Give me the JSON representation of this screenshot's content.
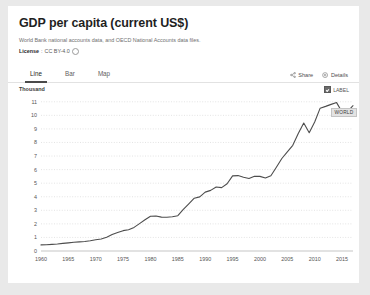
{
  "card": {
    "title": "GDP per capita (current US$)",
    "subtitle": "World Bank national accounts data, and OECD National Accounts data files.",
    "license_label": "License",
    "license_sep": ":",
    "license_value": "CC BY-4.0"
  },
  "tabs": [
    {
      "label": "Line",
      "active": true
    },
    {
      "label": "Bar",
      "active": false
    },
    {
      "label": "Map",
      "active": false
    }
  ],
  "actions": {
    "share": "Share",
    "details": "Details"
  },
  "legend": {
    "label": "LABEL",
    "checked": true
  },
  "series_badge": "WORLD",
  "colors": {
    "page_bg": "#e9e9e9",
    "card_bg": "#ffffff",
    "title": "#1f1f1f",
    "line": "#4d4d4d",
    "grid": "#d8d8d8",
    "axis": "#b6b6b6",
    "tab_active_underline": "#4a4a4a",
    "badge_bg": "#e3e3e3"
  },
  "chart_data": {
    "type": "line",
    "title": "GDP per capita (current US$)",
    "xlabel": "",
    "ylabel": "Thousand",
    "unit_scale": "Thousand",
    "grid": true,
    "legend_position": "top-right",
    "xlim": [
      1960,
      2017
    ],
    "ylim": [
      0,
      11.5
    ],
    "ytick_labels": [
      "0",
      "1",
      "2",
      "3",
      "4",
      "5",
      "6",
      "7",
      "8",
      "9",
      "10",
      "11"
    ],
    "yticks": [
      0,
      1,
      2,
      3,
      4,
      5,
      6,
      7,
      8,
      9,
      10,
      11
    ],
    "xtick_labels": [
      "1960",
      "1965",
      "1970",
      "1975",
      "1980",
      "1985",
      "1990",
      "1995",
      "2000",
      "2005",
      "2010",
      "2015"
    ],
    "xticks": [
      1960,
      1965,
      1970,
      1975,
      1980,
      1985,
      1990,
      1995,
      2000,
      2005,
      2010,
      2015
    ],
    "series": [
      {
        "name": "WORLD",
        "x": [
          1960,
          1961,
          1962,
          1963,
          1964,
          1965,
          1966,
          1967,
          1968,
          1969,
          1970,
          1971,
          1972,
          1973,
          1974,
          1975,
          1976,
          1977,
          1978,
          1979,
          1980,
          1981,
          1982,
          1983,
          1984,
          1985,
          1986,
          1987,
          1988,
          1989,
          1990,
          1991,
          1992,
          1993,
          1994,
          1995,
          1996,
          1997,
          1998,
          1999,
          2000,
          2001,
          2002,
          2003,
          2004,
          2005,
          2006,
          2007,
          2008,
          2009,
          2010,
          2011,
          2012,
          2013,
          2014,
          2015,
          2016,
          2017
        ],
        "y": [
          0.45,
          0.46,
          0.49,
          0.52,
          0.56,
          0.6,
          0.64,
          0.67,
          0.7,
          0.76,
          0.83,
          0.89,
          1.01,
          1.21,
          1.36,
          1.5,
          1.57,
          1.74,
          2.02,
          2.3,
          2.56,
          2.58,
          2.5,
          2.49,
          2.53,
          2.6,
          3.07,
          3.48,
          3.89,
          3.99,
          4.34,
          4.47,
          4.72,
          4.67,
          4.96,
          5.54,
          5.56,
          5.44,
          5.35,
          5.51,
          5.5,
          5.38,
          5.55,
          6.17,
          6.82,
          7.3,
          7.79,
          8.66,
          9.43,
          8.72,
          9.51,
          10.53,
          10.66,
          10.81,
          10.94,
          10.25,
          10.27,
          10.71
        ]
      }
    ]
  }
}
